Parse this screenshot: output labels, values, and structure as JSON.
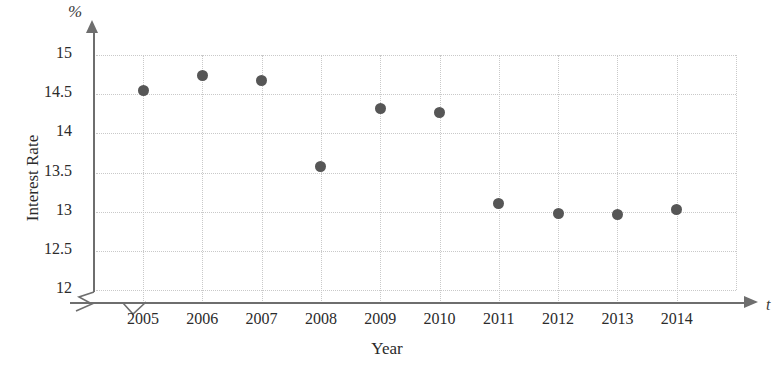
{
  "chart_data": {
    "type": "scatter",
    "title": "",
    "xlabel": "Year",
    "ylabel": "Interest Rate",
    "x_axis_symbol": "t",
    "y_axis_symbol": "%",
    "categories": [
      "2005",
      "2006",
      "2007",
      "2008",
      "2009",
      "2010",
      "2011",
      "2012",
      "2013",
      "2014"
    ],
    "x": [
      2005,
      2006,
      2007,
      2008,
      2009,
      2010,
      2011,
      2012,
      2013,
      2014
    ],
    "values": [
      14.55,
      14.74,
      14.68,
      13.58,
      14.32,
      14.27,
      13.11,
      12.98,
      12.96,
      13.03
    ],
    "series": [
      {
        "name": "Interest Rate",
        "values": [
          14.55,
          14.74,
          14.68,
          13.58,
          14.32,
          14.27,
          13.11,
          12.98,
          12.96,
          13.03
        ]
      }
    ],
    "ylim": [
      12,
      15
    ],
    "ytick_labels": [
      "15",
      "14.5",
      "14",
      "13.5",
      "13",
      "12.5",
      "12"
    ],
    "ytick_values": [
      15,
      14.5,
      14,
      13.5,
      13,
      12.5,
      12
    ],
    "grid": true,
    "grid_style": "dotted",
    "legend": "none",
    "y_axis_break": true,
    "x_axis_break": true,
    "marker_color": "#565656",
    "grid_color": "#c9c9c9",
    "axis_color": "#6e6e6e"
  }
}
